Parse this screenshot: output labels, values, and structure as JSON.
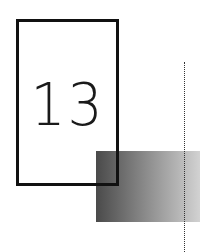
{
  "number_frame": {
    "label": "13",
    "border_color": "#111111"
  },
  "gradient_rect": {
    "color_start": "#4a4a4a",
    "color_end": "#d2d2d2"
  },
  "dotted_line": {
    "color": "#333333"
  }
}
